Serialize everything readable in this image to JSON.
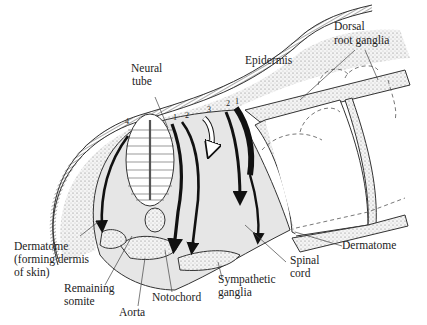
{
  "figure": {
    "type": "anatomical-diagram",
    "colors": {
      "background": "#ffffff",
      "tissue_fill": "#e6e6e6",
      "stipple_fill": "#cfcfcf",
      "arrow": "#111111",
      "line": "#333333"
    },
    "pathway_numbers": [
      "1",
      "2",
      "3",
      "4",
      "2",
      "1"
    ],
    "labels": {
      "neural_tube": [
        "Neural",
        "tube"
      ],
      "epidermis": [
        "Epidermis"
      ],
      "dorsal_root_ganglia": [
        "Dorsal",
        "root ganglia"
      ],
      "dermatome_left": [
        "Dermatome",
        "(forming dermis",
        "of skin)"
      ],
      "remaining_somite": [
        "Remaining",
        "somite"
      ],
      "aorta": [
        "Aorta"
      ],
      "notochord": [
        "Notochord"
      ],
      "sympathetic_ganglia": [
        "Sympathetic",
        "ganglia"
      ],
      "spinal_cord": [
        "Spinal",
        "cord"
      ],
      "dermatome_right": [
        "Dermatome"
      ]
    }
  }
}
